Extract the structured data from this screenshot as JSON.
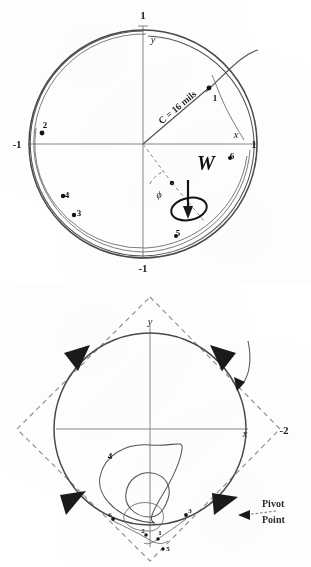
{
  "document": {
    "title": "Yawing motion of a spinning projectile — normalized yaw-plane plots",
    "background_color": "#ffffff",
    "ink_color": "#2b2b2b"
  },
  "figures": [
    {
      "id": "figure-top",
      "name": "epicyclic-yaw-plot",
      "caption": "",
      "axes": {
        "x_label": "x",
        "y_label": "y",
        "x_ticks": [
          {
            "label": "-1",
            "position": "left"
          },
          {
            "label": "1",
            "position": "right"
          }
        ],
        "y_ticks": [
          {
            "label": "1",
            "position": "top"
          },
          {
            "label": "-1",
            "position": "bottom"
          }
        ]
      },
      "annotations": {
        "radius_label": "C = 16 mils",
        "spin_label": "W",
        "angle_label": "ϕ"
      },
      "trajectory_points": [
        {
          "label": "1"
        },
        {
          "label": "2"
        },
        {
          "label": "3"
        },
        {
          "label": "4"
        },
        {
          "label": "5"
        },
        {
          "label": "6"
        }
      ]
    },
    {
      "id": "figure-bottom",
      "name": "pivot-point-yaw-plot",
      "caption": "",
      "axes": {
        "x_label": "x",
        "y_label": "y",
        "x_ticks": [
          {
            "label": "-2",
            "position": "right"
          }
        ],
        "y_ticks": []
      },
      "annotations": {
        "pivot_line_1": "Pivot",
        "pivot_line_2": "Point"
      },
      "trajectory_points": [
        {
          "label": "1"
        },
        {
          "label": "2"
        },
        {
          "label": "3"
        },
        {
          "label": "4"
        },
        {
          "label": "5"
        },
        {
          "label": "6"
        }
      ],
      "rotation_arrow_count": 4
    }
  ],
  "colors": {
    "ink": "#2b2b2b",
    "circle_stroke": "#4a4a4a",
    "axis_stroke": "#7b7b7b",
    "dashed_stroke": "#8a8a8a",
    "arrow_fill": "#1a1a1a"
  }
}
